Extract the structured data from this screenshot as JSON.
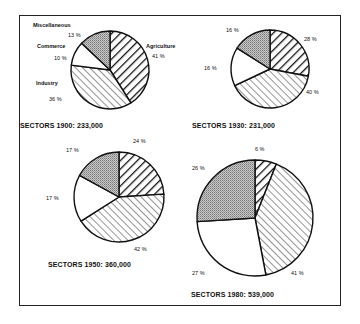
{
  "chart_data": [
    {
      "type": "pie",
      "title": "SECTORS 1900: 233,000",
      "year": "1900",
      "total": "233,000",
      "slices": [
        {
          "name": "Agriculture",
          "value": 41,
          "label": "41 %",
          "pattern": "heavy-hatch"
        },
        {
          "name": "Industry",
          "value": 36,
          "label": "36 %",
          "pattern": "light-hatch"
        },
        {
          "name": "Commerce",
          "value": 10,
          "label": "10 %",
          "pattern": "white"
        },
        {
          "name": "Miscellaneous",
          "value": 13,
          "label": "13 %",
          "pattern": "stipple"
        }
      ]
    },
    {
      "type": "pie",
      "title": "SECTORS 1930:  231,000",
      "year": "1930",
      "total": "231,000",
      "slices": [
        {
          "name": "Agriculture",
          "value": 28,
          "label": "28 %",
          "pattern": "heavy-hatch"
        },
        {
          "name": "Industry",
          "value": 40,
          "label": "40 %",
          "pattern": "light-hatch"
        },
        {
          "name": "Commerce",
          "value": 16,
          "label": "16 %",
          "pattern": "white"
        },
        {
          "name": "Miscellaneous",
          "value": 16,
          "label": "16 %",
          "pattern": "stipple"
        }
      ]
    },
    {
      "type": "pie",
      "title": "SECTORS 1950: 360,000",
      "year": "1950",
      "total": "360,000",
      "slices": [
        {
          "name": "Agriculture",
          "value": 24,
          "label": "24 %",
          "pattern": "heavy-hatch"
        },
        {
          "name": "Industry",
          "value": 42,
          "label": "42 %",
          "pattern": "light-hatch"
        },
        {
          "name": "Commerce",
          "value": 17,
          "label": "17 %",
          "pattern": "white"
        },
        {
          "name": "Miscellaneous",
          "value": 17,
          "label": "17 %",
          "pattern": "stipple"
        }
      ]
    },
    {
      "type": "pie",
      "title": "SECTORS 1980: 539,000",
      "year": "1980",
      "total": "539,000",
      "slices": [
        {
          "name": "Agriculture",
          "value": 6,
          "label": "6 %",
          "pattern": "heavy-hatch"
        },
        {
          "name": "Industry",
          "value": 41,
          "label": "41 %",
          "pattern": "light-hatch"
        },
        {
          "name": "Commerce",
          "value": 27,
          "label": "27 %",
          "pattern": "white"
        },
        {
          "name": "Miscellaneous",
          "value": 26,
          "label": "26 %",
          "pattern": "stipple"
        }
      ]
    }
  ],
  "legend_labels": {
    "miscellaneous": "Miscellaneous",
    "commerce": "Commerce",
    "industry": "Industry",
    "agriculture": "Agriculture"
  },
  "colors": {
    "stroke": "#111111",
    "stipple": "#b0b0b0",
    "background": "#ffffff"
  }
}
